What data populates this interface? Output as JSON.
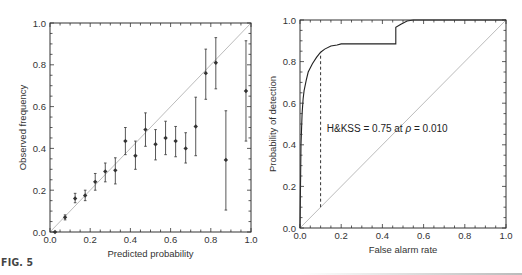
{
  "figure": {
    "label": "FIG. 5"
  },
  "chart_data": [
    {
      "type": "scatter",
      "title": "",
      "xlabel": "Predicted probability",
      "ylabel": "Observed frequency",
      "xlim": [
        0,
        1
      ],
      "ylim": [
        0,
        1
      ],
      "xticks": [
        "0.0",
        "0.2",
        "0.4",
        "0.6",
        "0.8",
        "1.0"
      ],
      "yticks": [
        "0.0",
        "0.2",
        "0.4",
        "0.6",
        "0.8",
        "1.0"
      ],
      "grid": false,
      "reference_line": {
        "type": "diagonal",
        "from": [
          0,
          0
        ],
        "to": [
          1,
          1
        ],
        "color": "#aaaaaa"
      },
      "series": [
        {
          "name": "reliability",
          "marker": "diamond",
          "error_bars": true,
          "points": [
            {
              "x": 0.025,
              "y": 0.0,
              "lo": 0.0,
              "hi": 0.0
            },
            {
              "x": 0.075,
              "y": 0.07,
              "lo": 0.058,
              "hi": 0.082
            },
            {
              "x": 0.125,
              "y": 0.16,
              "lo": 0.14,
              "hi": 0.185
            },
            {
              "x": 0.175,
              "y": 0.175,
              "lo": 0.15,
              "hi": 0.2
            },
            {
              "x": 0.225,
              "y": 0.24,
              "lo": 0.2,
              "hi": 0.28
            },
            {
              "x": 0.275,
              "y": 0.29,
              "lo": 0.24,
              "hi": 0.33
            },
            {
              "x": 0.325,
              "y": 0.295,
              "lo": 0.23,
              "hi": 0.355
            },
            {
              "x": 0.375,
              "y": 0.435,
              "lo": 0.37,
              "hi": 0.5
            },
            {
              "x": 0.425,
              "y": 0.365,
              "lo": 0.3,
              "hi": 0.435
            },
            {
              "x": 0.475,
              "y": 0.49,
              "lo": 0.41,
              "hi": 0.57
            },
            {
              "x": 0.525,
              "y": 0.42,
              "lo": 0.345,
              "hi": 0.49
            },
            {
              "x": 0.575,
              "y": 0.45,
              "lo": 0.37,
              "hi": 0.53
            },
            {
              "x": 0.625,
              "y": 0.435,
              "lo": 0.36,
              "hi": 0.505
            },
            {
              "x": 0.675,
              "y": 0.4,
              "lo": 0.33,
              "hi": 0.475
            },
            {
              "x": 0.725,
              "y": 0.505,
              "lo": 0.365,
              "hi": 0.645
            },
            {
              "x": 0.775,
              "y": 0.76,
              "lo": 0.635,
              "hi": 0.875
            },
            {
              "x": 0.825,
              "y": 0.81,
              "lo": 0.685,
              "hi": 0.93
            },
            {
              "x": 0.875,
              "y": 0.345,
              "lo": 0.105,
              "hi": 0.58
            },
            {
              "x": 0.975,
              "y": 0.675,
              "lo": 0.435,
              "hi": 0.915
            }
          ]
        }
      ]
    },
    {
      "type": "line",
      "title": "",
      "xlabel": "False alarm rate",
      "ylabel": "Probability of detection",
      "xlim": [
        0,
        1
      ],
      "ylim": [
        0,
        1
      ],
      "xticks": [
        "0.0",
        "0.2",
        "0.4",
        "0.6",
        "0.8",
        "1.0"
      ],
      "yticks": [
        "0.0",
        "0.2",
        "0.4",
        "0.6",
        "0.8",
        "1.0"
      ],
      "grid": false,
      "reference_line": {
        "type": "diagonal",
        "from": [
          0,
          0
        ],
        "to": [
          1,
          1
        ],
        "color": "#aaaaaa"
      },
      "series": [
        {
          "name": "ROC curve",
          "x": [
            0.0,
            0.005,
            0.01,
            0.015,
            0.02,
            0.03,
            0.04,
            0.06,
            0.08,
            0.1,
            0.12,
            0.15,
            0.18,
            0.2,
            0.3,
            0.4,
            0.465,
            0.465,
            0.49,
            0.52,
            0.55,
            0.6,
            0.7,
            0.8,
            1.0
          ],
          "y": [
            0.0,
            0.4,
            0.55,
            0.62,
            0.66,
            0.71,
            0.75,
            0.79,
            0.82,
            0.845,
            0.86,
            0.875,
            0.88,
            0.885,
            0.885,
            0.885,
            0.885,
            0.965,
            0.98,
            0.995,
            1.0,
            1.0,
            1.0,
            1.0,
            1.0
          ]
        }
      ],
      "annotations": [
        {
          "text": "H&KSS = 0.75 at ρ = 0.010",
          "x": 0.13,
          "y": 0.46
        },
        {
          "type": "dashed-vline",
          "x": 0.1,
          "y_from": 0.1,
          "y_to": 0.845
        }
      ]
    }
  ],
  "annotation_text": {
    "prefix": "H&KSS = 0.75 at ",
    "rho": "ρ",
    "suffix": " = 0.010"
  }
}
